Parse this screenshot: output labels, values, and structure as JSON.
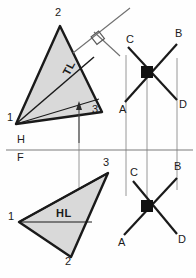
{
  "drawing": {
    "title": "Descriptive geometry: true length and horizontal line in triangle 1-2-3",
    "background_color": "#fefefe",
    "ink_color": "#1a1a1a",
    "fill_color": "#d9d9d9",
    "thin_color": "#8c8c8c"
  },
  "fold_line": {
    "upper_label": "H",
    "lower_label": "F",
    "y": 150,
    "x_start": 6,
    "x_end": 193
  },
  "top_view": {
    "name": "horizontal-view",
    "triangle": {
      "points": "16,124 60,26 102,112",
      "vertices": [
        {
          "label": "1",
          "x": 7,
          "y": 118
        },
        {
          "label": "2",
          "x": 55,
          "y": 13
        },
        {
          "label": "3",
          "x": 92,
          "y": 110
        }
      ]
    },
    "true_length_label": "TL",
    "true_length_line": {
      "x1": 16,
      "y1": 124,
      "x2": 94,
      "y2": 57
    },
    "horizontal_chord": {
      "x1": 16,
      "y1": 124,
      "x2": 99,
      "y2": 99
    },
    "oblique_line": {
      "x1": 73,
      "y1": 53,
      "x2": 130,
      "y2": 8
    },
    "perpendicular_line": {
      "x1": 94,
      "y1": 32,
      "x2": 116,
      "y2": 54
    },
    "right_angle_marker": {
      "cx": 97,
      "cy": 37,
      "size": 9
    },
    "arrow": {
      "x": 79,
      "y_tail": 142,
      "y_head": 104
    }
  },
  "front_view": {
    "name": "frontal-view",
    "triangle": {
      "points": "19,222 108,173 71,257",
      "vertices": [
        {
          "label": "1",
          "x": 8,
          "y": 217
        },
        {
          "label": "3",
          "x": 103,
          "y": 163
        },
        {
          "label": "2",
          "x": 65,
          "y": 261
        }
      ]
    },
    "horizontal_line_label": "HL",
    "horizontal_line": {
      "x1": 19,
      "y1": 222,
      "x2": 90,
      "y2": 222
    },
    "edge_chord": {
      "x1": 19,
      "y1": 222,
      "x2": 108,
      "y2": 173
    }
  },
  "top_crossing": {
    "name": "top-intersection",
    "node": {
      "x": 147,
      "y": 72
    },
    "endpoints": [
      {
        "label": "C",
        "x": 128,
        "y": 47,
        "lx": 126,
        "ly": 38
      },
      {
        "label": "B",
        "x": 177,
        "y": 44,
        "lx": 176,
        "ly": 33
      },
      {
        "label": "A",
        "x": 125,
        "y": 102,
        "lx": 120,
        "ly": 109
      },
      {
        "label": "D",
        "x": 177,
        "y": 100,
        "lx": 179,
        "ly": 104
      }
    ]
  },
  "bottom_crossing": {
    "name": "bottom-intersection",
    "node": {
      "x": 147,
      "y": 206
    },
    "endpoints": [
      {
        "label": "C",
        "x": 133,
        "y": 181,
        "lx": 130,
        "ly": 172
      },
      {
        "label": "B",
        "x": 177,
        "y": 178,
        "lx": 175,
        "ly": 167
      },
      {
        "label": "A",
        "x": 124,
        "y": 235,
        "lx": 119,
        "ly": 241
      },
      {
        "label": "D",
        "x": 177,
        "y": 234,
        "lx": 178,
        "ly": 240
      }
    ]
  },
  "projection_lines": [
    {
      "name": "projector-c",
      "x": 126,
      "y_top": 55,
      "y_bottom": 196
    },
    {
      "name": "projector-node",
      "x": 147,
      "y_top": 74,
      "y_bottom": 200
    },
    {
      "name": "projector-d",
      "x": 177,
      "y_top": 58,
      "y_bottom": 190
    },
    {
      "name": "projector-triangle",
      "x": 79,
      "y_top": 98,
      "y_bottom": 220
    }
  ]
}
